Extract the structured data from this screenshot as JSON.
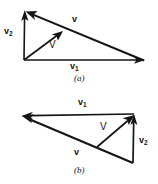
{
  "figure": {
    "background_color": "#ffffff",
    "ink_color": "#151515",
    "panels": [
      {
        "id": "a",
        "caption": "(a)",
        "labels": {
          "v_component_1": "v",
          "v_component_1_sub": "1",
          "v_component_2": "v",
          "v_component_2_sub": "2",
          "v_small": "v",
          "v_capital": "V"
        },
        "vectors": [
          {
            "name": "v1",
            "label": "v",
            "subscript": "1",
            "from": [
              24,
              60
            ],
            "to": [
              144,
              60
            ],
            "label_pos": [
              72,
              64
            ]
          },
          {
            "name": "v2",
            "label": "v",
            "subscript": "2",
            "from": [
              24,
              60
            ],
            "to": [
              25,
              11
            ],
            "label_pos": [
              5,
              27
            ]
          },
          {
            "name": "v-small",
            "label": "v",
            "subscript": "",
            "from": [
              144,
              60
            ],
            "to": [
              25,
              11
            ],
            "label_pos": [
              73,
              17
            ]
          },
          {
            "name": "V-capital",
            "label": "V",
            "subscript": "",
            "from": [
              24,
              60
            ],
            "to": [
              62,
              32
            ],
            "label_pos": [
              49,
              41
            ]
          }
        ]
      },
      {
        "id": "b",
        "caption": "(b)",
        "labels": {
          "v_component_1": "v",
          "v_component_1_sub": "1",
          "v_component_2": "v",
          "v_component_2_sub": "2",
          "v_small": "v",
          "v_capital": "V"
        },
        "vectors": [
          {
            "name": "v1",
            "label": "v",
            "subscript": "1",
            "from": [
              134,
              114
            ],
            "to": [
              22,
              116
            ],
            "label_pos": [
              78,
              99
            ]
          },
          {
            "name": "v2",
            "label": "v",
            "subscript": "2",
            "from": [
              133,
              163
            ],
            "to": [
              134,
              115
            ],
            "label_pos": [
              139,
              138
            ]
          },
          {
            "name": "v-small",
            "label": "v",
            "subscript": "",
            "from": [
              133,
              163
            ],
            "to": [
              22,
              116
            ],
            "label_pos": [
              74,
              150
            ]
          },
          {
            "name": "V-capital",
            "label": "V",
            "subscript": "",
            "from": [
              97,
              147
            ],
            "to": [
              134,
              115
            ],
            "label_pos": [
              100,
              124
            ]
          }
        ]
      }
    ]
  }
}
